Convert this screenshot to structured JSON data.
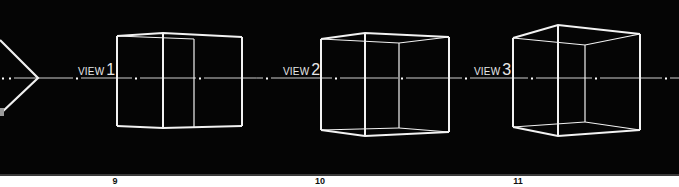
{
  "diagram": {
    "background_color": "#050505",
    "line_color": "#f2f2f2",
    "horizon_y": 78,
    "horizon_dots_x": [
      3,
      10,
      77,
      136,
      200,
      267,
      336,
      402,
      466,
      532,
      596,
      666
    ],
    "views": [
      {
        "label_word": "VIEW",
        "label_number": "1",
        "figure_number": "9"
      },
      {
        "label_word": "VIEW",
        "label_number": "2",
        "figure_number": "10"
      },
      {
        "label_word": "VIEW",
        "label_number": "3",
        "figure_number": "11"
      }
    ]
  }
}
